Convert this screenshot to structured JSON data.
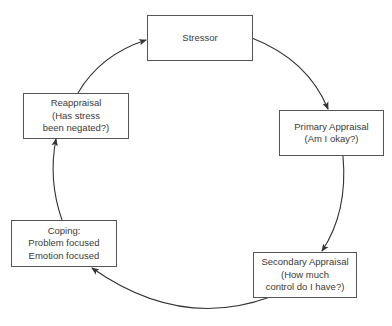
{
  "diagram": {
    "type": "cycle",
    "title": "",
    "colors": {
      "line": "#333333",
      "box_border": "#555555",
      "text": "#3a3a3a",
      "background": "#ffffff"
    },
    "nodes": [
      {
        "id": "stressor",
        "lines": [
          "Stressor"
        ]
      },
      {
        "id": "primary",
        "lines": [
          "Primary Appraisal",
          "(Am I okay?)"
        ]
      },
      {
        "id": "secondary",
        "lines": [
          "Secondary Appraisal",
          "(How much",
          "control do I have?)"
        ]
      },
      {
        "id": "coping",
        "lines": [
          "Coping:",
          "Problem focused",
          "Emotion focused"
        ]
      },
      {
        "id": "reappraisal",
        "lines": [
          "Reappraisal",
          "(Has stress",
          "been negated?)"
        ]
      }
    ],
    "edges": [
      {
        "from": "stressor",
        "to": "primary"
      },
      {
        "from": "primary",
        "to": "secondary"
      },
      {
        "from": "secondary",
        "to": "coping"
      },
      {
        "from": "coping",
        "to": "reappraisal"
      },
      {
        "from": "reappraisal",
        "to": "stressor"
      }
    ]
  }
}
